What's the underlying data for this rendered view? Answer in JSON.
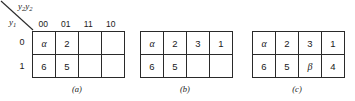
{
  "figure": {
    "axis": {
      "column_variable": "y",
      "column_variable_sub1": "2",
      "column_variable_2": "y",
      "column_variable_sub2": "2",
      "column_label_full": "y2y2",
      "row_variable": "y",
      "row_variable_sub": "1",
      "row_label_full": "y1",
      "diagonal_icon": "diagonal-divider-line"
    },
    "column_headers": [
      "00",
      "01",
      "11",
      "10"
    ],
    "row_headers": [
      "0",
      "1"
    ],
    "maps": [
      {
        "id": "a",
        "caption": "(a)",
        "rows": [
          [
            "α",
            "2",
            "",
            ""
          ],
          [
            "6",
            "5",
            "",
            ""
          ]
        ]
      },
      {
        "id": "b",
        "caption": "(b)",
        "rows": [
          [
            "α",
            "2",
            "3",
            "1"
          ],
          [
            "6",
            "5",
            "",
            ""
          ]
        ]
      },
      {
        "id": "c",
        "caption": "(c)",
        "rows": [
          [
            "α",
            "2",
            "3",
            "1"
          ],
          [
            "6",
            "5",
            "β",
            "4"
          ]
        ]
      }
    ],
    "colors": {
      "background": "#ffffff",
      "line": "#2a2a2a",
      "text": "#1a1a1a"
    }
  }
}
